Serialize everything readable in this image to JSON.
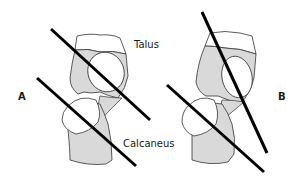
{
  "figure": {
    "labels": {
      "talus": "Talus",
      "calcaneus": "Calcaneus",
      "panel_a": "A",
      "panel_b": "B"
    },
    "colors": {
      "bone_fill": "#d9d9d9",
      "bone_outline": "#333333",
      "joint_fill": "#ffffff",
      "axis_line": "#000000",
      "text": "#1a1a1a"
    },
    "panels": [
      {
        "id": "A",
        "axis_lines": [
          {
            "name": "talus-axis",
            "x1": 51,
            "y1": 29,
            "x2": 150,
            "y2": 120
          },
          {
            "name": "calcaneus-axis",
            "x1": 37,
            "y1": 78,
            "x2": 136,
            "y2": 166
          }
        ]
      },
      {
        "id": "B",
        "axis_lines": [
          {
            "name": "talus-axis",
            "x1": 202,
            "y1": 12,
            "x2": 267,
            "y2": 153
          },
          {
            "name": "calcaneus-axis",
            "x1": 167,
            "y1": 85,
            "x2": 264,
            "y2": 172
          }
        ]
      }
    ]
  }
}
